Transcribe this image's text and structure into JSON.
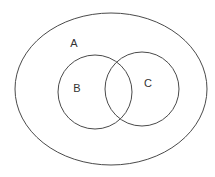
{
  "diagram": {
    "type": "venn",
    "background": "#ffffff",
    "stroke_color": "#4a4a4a",
    "sets": [
      {
        "id": "A",
        "label": "A",
        "shape": "ellipse",
        "cx": 111,
        "cy": 89,
        "rx": 96,
        "ry": 76,
        "label_x": 74,
        "label_y": 43,
        "contains": [
          "B",
          "C"
        ]
      },
      {
        "id": "B",
        "label": "B",
        "shape": "circle",
        "cx": 95,
        "cy": 92,
        "r": 37,
        "label_x": 77,
        "label_y": 88
      },
      {
        "id": "C",
        "label": "C",
        "shape": "circle",
        "cx": 142,
        "cy": 89,
        "r": 37,
        "label_x": 148,
        "label_y": 83
      }
    ],
    "relations": [
      "B ⊂ A",
      "C ⊂ A",
      "B ∩ C ≠ ∅"
    ]
  }
}
